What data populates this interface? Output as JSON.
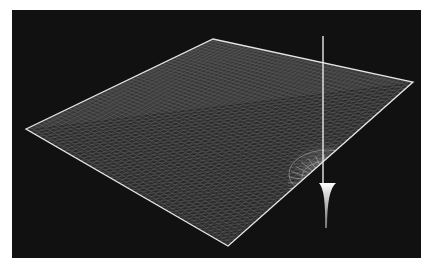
{
  "figure": {
    "background_color": "#111111",
    "page_color": "#ffffff",
    "mesh_color": "#e6e6e6",
    "grid_color": "#8a8a8a",
    "mesh": {
      "corners": {
        "left": [
          26,
          129
        ],
        "top": [
          213,
          39
        ],
        "right": [
          413,
          82
        ],
        "bottom": [
          228,
          246
        ]
      }
    },
    "vertical_line": {
      "x": 323,
      "y_top": 36,
      "y_bottom": 228
    },
    "cusp": {
      "x": 328,
      "y": 183
    }
  }
}
